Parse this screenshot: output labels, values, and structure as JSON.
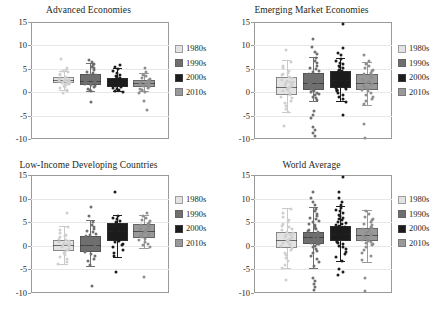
{
  "figure": {
    "decade_labels": [
      "1980s",
      "1990s",
      "2000s",
      "2010s"
    ],
    "colors": {
      "1980s": "#e3e3e3",
      "1990s": "#6f6f6f",
      "2000s": "#1c1c1c",
      "2010s": "#999999",
      "frame": "#9a9a9a",
      "gridline": "#e7e7e7",
      "text": "#231f20"
    }
  },
  "chart_data": [
    {
      "type": "box",
      "title": "Advanced Economies",
      "xlabel": "",
      "ylabel": "",
      "ylim": [
        -10,
        15
      ],
      "yticks": [
        15,
        10,
        5,
        0,
        -5,
        -10
      ],
      "grid": true,
      "legend_position": "right",
      "categories": [
        "1980s",
        "1990s",
        "2000s",
        "2010s"
      ],
      "series": [
        {
          "name": "1980s",
          "color": "#e3e3e3",
          "q1": 1.9,
          "median": 2.6,
          "q3": 3.3,
          "whisker_low": 0.5,
          "whisker_high": 4.6,
          "outliers": [
            7.5,
            5.6,
            5.1,
            4.8,
            0.1
          ],
          "points": [
            4.6,
            4.2,
            3.9,
            3.6,
            3.4,
            3.2,
            3.1,
            3.0,
            2.9,
            2.8,
            2.7,
            2.6,
            2.5,
            2.4,
            2.3,
            2.2,
            2.1,
            2.0,
            1.9,
            1.7,
            1.5,
            1.2,
            0.9,
            0.6
          ]
        },
        {
          "name": "1990s",
          "color": "#6f6f6f",
          "q1": 1.6,
          "median": 2.5,
          "q3": 3.9,
          "whisker_low": 0.3,
          "whisker_high": 6.2,
          "outliers": [
            7.2,
            6.8,
            6.4,
            -1.8
          ],
          "points": [
            6.2,
            5.8,
            5.4,
            5.0,
            4.7,
            4.4,
            4.1,
            3.9,
            3.7,
            3.5,
            3.3,
            3.1,
            2.9,
            2.7,
            2.6,
            2.5,
            2.4,
            2.3,
            2.2,
            2.0,
            1.8,
            1.6,
            1.4,
            1.1,
            0.8,
            0.5
          ]
        },
        {
          "name": "2000s",
          "color": "#1c1c1c",
          "q1": 1.1,
          "median": 2.0,
          "q3": 3.0,
          "whisker_low": 0.2,
          "whisker_high": 5.2,
          "outliers": [
            6.1,
            5.7
          ],
          "points": [
            5.2,
            4.8,
            4.4,
            4.1,
            3.8,
            3.5,
            3.3,
            3.1,
            2.9,
            2.7,
            2.5,
            2.4,
            2.3,
            2.2,
            2.1,
            2.0,
            1.9,
            1.8,
            1.6,
            1.4,
            1.2,
            1.0,
            0.8,
            0.6,
            0.4
          ]
        },
        {
          "name": "2010s",
          "color": "#999999",
          "q1": 1.2,
          "median": 1.9,
          "q3": 2.6,
          "whisker_low": 0.3,
          "whisker_high": 4.0,
          "outliers": [
            5.6,
            4.6,
            -1.6,
            -3.4
          ],
          "points": [
            4.0,
            3.7,
            3.4,
            3.1,
            2.9,
            2.7,
            2.5,
            2.4,
            2.3,
            2.2,
            2.1,
            2.0,
            1.9,
            1.8,
            1.6,
            1.5,
            1.3,
            1.1,
            0.9,
            0.7,
            0.4,
            0.2
          ]
        }
      ]
    },
    {
      "type": "box",
      "title": "Emerging Market Economies",
      "xlabel": "",
      "ylabel": "",
      "ylim": [
        -10,
        15
      ],
      "yticks": [
        15,
        10,
        5,
        0,
        -5,
        -10
      ],
      "grid": true,
      "legend_position": "right",
      "categories": [
        "1980s",
        "1990s",
        "2000s",
        "2010s"
      ],
      "series": [
        {
          "name": "1980s",
          "color": "#e3e3e3",
          "q1": -0.6,
          "median": 1.2,
          "q3": 3.2,
          "whisker_low": -4.2,
          "whisker_high": 6.8,
          "outliers": [
            9.4,
            -7.0
          ],
          "points": [
            6.8,
            6.0,
            5.4,
            4.9,
            4.5,
            4.2,
            3.9,
            3.6,
            3.3,
            3.0,
            2.8,
            2.6,
            2.4,
            2.2,
            2.0,
            1.8,
            1.6,
            1.4,
            1.2,
            1.0,
            0.8,
            0.5,
            0.2,
            -0.2,
            -0.6,
            -1.0,
            -1.5,
            -2.0,
            -2.6,
            -3.2,
            -4.0
          ]
        },
        {
          "name": "1990s",
          "color": "#6f6f6f",
          "q1": 0.4,
          "median": 1.9,
          "q3": 4.0,
          "whisker_low": -1.8,
          "whisker_high": 7.6,
          "outliers": [
            11.7,
            10.0,
            9.0,
            8.4,
            -3.6,
            -4.5,
            -5.1,
            -7.2,
            -7.8,
            -8.4,
            -9.0
          ],
          "points": [
            7.6,
            7.0,
            6.5,
            6.0,
            5.6,
            5.2,
            4.9,
            4.6,
            4.3,
            4.0,
            3.7,
            3.4,
            3.2,
            3.0,
            2.8,
            2.6,
            2.4,
            2.2,
            2.0,
            1.8,
            1.6,
            1.4,
            1.2,
            1.0,
            0.8,
            0.6,
            0.4,
            0.2,
            0.0,
            -0.3,
            -0.6,
            -1.0,
            -1.4
          ]
        },
        {
          "name": "2000s",
          "color": "#1c1c1c",
          "q1": 0.8,
          "median": 2.6,
          "q3": 4.5,
          "whisker_low": -1.9,
          "whisker_high": 7.4,
          "outliers": [
            14.8,
            9.8,
            8.8,
            8.2,
            -4.6
          ],
          "points": [
            7.4,
            7.0,
            6.6,
            6.3,
            6.0,
            5.7,
            5.4,
            5.1,
            4.9,
            4.7,
            4.5,
            4.3,
            4.1,
            3.9,
            3.7,
            3.5,
            3.3,
            3.1,
            2.9,
            2.7,
            2.5,
            2.3,
            2.1,
            1.9,
            1.7,
            1.5,
            1.3,
            1.1,
            0.9,
            0.7,
            0.5,
            0.2,
            -0.2,
            -0.7,
            -1.2,
            -1.7
          ]
        },
        {
          "name": "2010s",
          "color": "#999999",
          "q1": 0.5,
          "median": 2.0,
          "q3": 3.9,
          "whisker_low": -2.7,
          "whisker_high": 6.4,
          "outliers": [
            8.3,
            7.0,
            -6.5,
            -9.4
          ],
          "points": [
            6.4,
            5.9,
            5.5,
            5.1,
            4.8,
            4.5,
            4.2,
            3.9,
            3.6,
            3.3,
            3.0,
            2.8,
            2.6,
            2.4,
            2.2,
            2.0,
            1.8,
            1.6,
            1.4,
            1.2,
            1.0,
            0.8,
            0.5,
            0.2,
            -0.2,
            -0.6,
            -1.1,
            -1.6,
            -2.2
          ]
        }
      ]
    },
    {
      "type": "box",
      "title": "Low-Income Developing Countries",
      "xlabel": "",
      "ylabel": "",
      "ylim": [
        -10,
        15
      ],
      "yticks": [
        15,
        10,
        5,
        0,
        -5,
        -10
      ],
      "grid": true,
      "legend_position": "right",
      "categories": [
        "1980s",
        "1990s",
        "2000s",
        "2010s"
      ],
      "series": [
        {
          "name": "1980s",
          "color": "#e3e3e3",
          "q1": -1.1,
          "median": 0.1,
          "q3": 1.3,
          "whisker_low": -3.8,
          "whisker_high": 4.2,
          "outliers": [
            7.2
          ],
          "points": [
            4.2,
            3.6,
            3.1,
            2.7,
            2.4,
            2.1,
            1.8,
            1.6,
            1.4,
            1.2,
            1.0,
            0.8,
            0.6,
            0.4,
            0.2,
            0.0,
            -0.3,
            -0.6,
            -0.9,
            -1.2,
            -1.6,
            -2.0,
            -2.5,
            -3.1,
            -3.6
          ]
        },
        {
          "name": "1990s",
          "color": "#6f6f6f",
          "q1": -1.3,
          "median": 0.2,
          "q3": 2.1,
          "whisker_low": -4.2,
          "whisker_high": 5.4,
          "outliers": [
            8.6,
            6.6,
            -8.2
          ],
          "points": [
            5.4,
            4.8,
            4.3,
            3.9,
            3.5,
            3.2,
            2.9,
            2.6,
            2.3,
            2.0,
            1.7,
            1.4,
            1.2,
            1.0,
            0.7,
            0.4,
            0.1,
            -0.2,
            -0.6,
            -1.0,
            -1.4,
            -1.9,
            -2.4,
            -3.0,
            -3.7
          ]
        },
        {
          "name": "2000s",
          "color": "#1c1c1c",
          "q1": 1.0,
          "median": 3.1,
          "q3": 4.9,
          "whisker_low": -2.3,
          "whisker_high": 6.6,
          "outliers": [
            11.8,
            -5.3
          ],
          "points": [
            6.6,
            6.2,
            5.9,
            5.6,
            5.3,
            5.0,
            4.8,
            4.6,
            4.4,
            4.2,
            4.0,
            3.8,
            3.6,
            3.4,
            3.2,
            3.0,
            2.8,
            2.6,
            2.4,
            2.2,
            2.0,
            1.7,
            1.4,
            1.1,
            0.8,
            0.4,
            0.0,
            -0.5,
            -1.1,
            -1.8
          ]
        },
        {
          "name": "2010s",
          "color": "#999999",
          "q1": 1.7,
          "median": 3.2,
          "q3": 4.7,
          "whisker_low": -0.4,
          "whisker_high": 6.6,
          "outliers": [
            7.2,
            -6.2
          ],
          "points": [
            6.6,
            6.2,
            5.8,
            5.5,
            5.2,
            4.9,
            4.7,
            4.5,
            4.3,
            4.1,
            3.9,
            3.7,
            3.5,
            3.3,
            3.1,
            2.9,
            2.7,
            2.5,
            2.3,
            2.1,
            1.8,
            1.5,
            1.2,
            0.8,
            0.4,
            0.0
          ]
        }
      ]
    },
    {
      "type": "box",
      "title": "World Average",
      "xlabel": "",
      "ylabel": "",
      "ylim": [
        -10,
        15
      ],
      "yticks": [
        15,
        10,
        5,
        0,
        -5,
        -10
      ],
      "grid": true,
      "legend_position": "right",
      "categories": [
        "1980s",
        "1990s",
        "2000s",
        "2010s"
      ],
      "series": [
        {
          "name": "1980s",
          "color": "#e3e3e3",
          "q1": -0.5,
          "median": 1.2,
          "q3": 3.0,
          "whisker_low": -4.6,
          "whisker_high": 8.1,
          "outliers": [
            -7.0
          ],
          "points": [
            8.1,
            7.2,
            6.4,
            5.8,
            5.3,
            4.9,
            4.5,
            4.2,
            3.9,
            3.6,
            3.3,
            3.0,
            2.8,
            2.6,
            2.4,
            2.2,
            2.0,
            1.8,
            1.6,
            1.4,
            1.2,
            1.0,
            0.8,
            0.5,
            0.2,
            -0.2,
            -0.6,
            -1.1,
            -1.6,
            -2.2,
            -2.9,
            -3.7,
            -4.4
          ]
        },
        {
          "name": "1990s",
          "color": "#6f6f6f",
          "q1": 0.3,
          "median": 1.8,
          "q3": 3.0,
          "whisker_low": -4.8,
          "whisker_high": 8.2,
          "outliers": [
            11.8,
            10.4,
            9.6,
            9.0,
            -6.5,
            -7.2,
            -7.8,
            -8.4,
            -9.1
          ],
          "points": [
            8.2,
            7.6,
            7.1,
            6.7,
            6.3,
            5.9,
            5.6,
            5.3,
            5.0,
            4.7,
            4.4,
            4.1,
            3.8,
            3.6,
            3.4,
            3.2,
            3.0,
            2.8,
            2.6,
            2.4,
            2.2,
            2.0,
            1.8,
            1.6,
            1.4,
            1.2,
            1.0,
            0.8,
            0.6,
            0.3,
            0.0,
            -0.4,
            -0.8,
            -1.3,
            -1.8,
            -2.4,
            -3.1,
            -3.9
          ]
        },
        {
          "name": "2000s",
          "color": "#1c1c1c",
          "q1": 1.1,
          "median": 2.4,
          "q3": 4.2,
          "whisker_low": -3.2,
          "whisker_high": 8.4,
          "outliers": [
            14.9,
            11.8,
            10.4,
            9.6,
            9.0,
            -4.6,
            -5.2,
            -5.8
          ],
          "points": [
            8.4,
            8.0,
            7.6,
            7.2,
            6.9,
            6.6,
            6.3,
            6.0,
            5.7,
            5.4,
            5.1,
            4.9,
            4.7,
            4.5,
            4.3,
            4.1,
            3.9,
            3.7,
            3.5,
            3.3,
            3.1,
            2.9,
            2.7,
            2.5,
            2.3,
            2.1,
            1.9,
            1.7,
            1.5,
            1.3,
            1.1,
            0.9,
            0.6,
            0.3,
            0.0,
            -0.4,
            -0.9,
            -1.5,
            -2.1,
            -2.8
          ]
        },
        {
          "name": "2010s",
          "color": "#999999",
          "q1": 1.1,
          "median": 2.2,
          "q3": 3.7,
          "whisker_low": -3.4,
          "whisker_high": 7.6,
          "outliers": [
            -6.5,
            -9.3
          ],
          "points": [
            7.6,
            7.0,
            6.5,
            6.1,
            5.7,
            5.3,
            5.0,
            4.7,
            4.4,
            4.1,
            3.8,
            3.6,
            3.4,
            3.2,
            3.0,
            2.8,
            2.6,
            2.4,
            2.2,
            2.0,
            1.8,
            1.6,
            1.4,
            1.2,
            1.0,
            0.7,
            0.4,
            0.0,
            -0.5,
            -1.1,
            -1.8,
            -2.6
          ]
        }
      ]
    }
  ]
}
